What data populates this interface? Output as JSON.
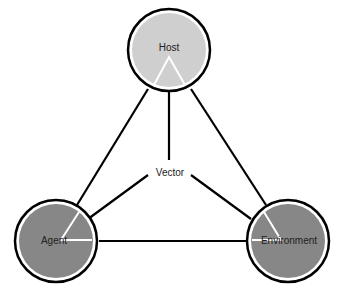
{
  "diagram": {
    "nodes": [
      {
        "id": "host",
        "label": "Host",
        "fill": "#cfcfcf"
      },
      {
        "id": "agent",
        "label": "Agent",
        "fill": "#878787"
      },
      {
        "id": "environment",
        "label": "Environment",
        "fill": "#878787"
      }
    ],
    "center_label": "Vector",
    "edges": [
      [
        "host",
        "agent"
      ],
      [
        "host",
        "environment"
      ],
      [
        "agent",
        "environment"
      ],
      [
        "vector",
        "host"
      ],
      [
        "vector",
        "agent"
      ],
      [
        "vector",
        "environment"
      ]
    ],
    "colors": {
      "stroke": "#000000",
      "background": "#ffffff",
      "wedge_line": "#ffffff"
    }
  }
}
